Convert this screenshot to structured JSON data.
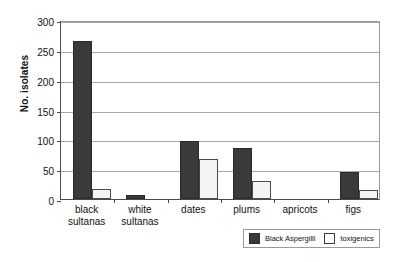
{
  "chart_data": {
    "type": "bar",
    "title": "",
    "xlabel": "",
    "ylabel": "No. isolates",
    "ylim": [
      0,
      300
    ],
    "yticks": [
      0,
      50,
      100,
      150,
      200,
      250,
      300
    ],
    "grid": true,
    "legend_position": "bottom-right",
    "categories": [
      "black sultanas",
      "white sultanas",
      "dates",
      "plums",
      "apricots",
      "figs"
    ],
    "category_lines": [
      [
        "black",
        "sultanas"
      ],
      [
        "white",
        "sultanas"
      ],
      [
        "dates"
      ],
      [
        "plums"
      ],
      [
        "apricots"
      ],
      [
        "figs"
      ]
    ],
    "series": [
      {
        "name": "Black Aspergilli",
        "color": "#3a3a3a",
        "values": [
          265,
          6,
          97,
          86,
          0,
          46
        ]
      },
      {
        "name": "toxigenics",
        "color": "#ffffff",
        "values": [
          17,
          0,
          67,
          30,
          0,
          15
        ]
      }
    ]
  },
  "legend": {
    "items": [
      {
        "label": "Black Aspergilli",
        "swatch": "dark"
      },
      {
        "label": "toxigenics",
        "swatch": "light"
      }
    ]
  },
  "colors": {
    "bar_dark": "#3a3a3a",
    "bar_light": "#f4f4f4",
    "gridline": "#a8a8a8",
    "axis": "#4a4a4a",
    "background": "#ffffff"
  }
}
